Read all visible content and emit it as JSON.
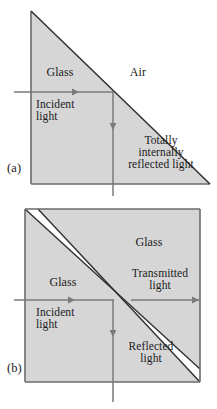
{
  "figure": {
    "colors": {
      "glass_fill": "#d6d6d6",
      "outline": "#6b6b6b",
      "diagonal_edge": "#3a3a3a",
      "air_gap": "#ffffff",
      "ray": "#7a7a7a",
      "text": "#1a1a1a",
      "background": "#ffffff"
    },
    "panels": [
      {
        "id": "a",
        "id_label": "(a)",
        "shape": "right-triangle-prism",
        "regions": [
          {
            "name": "glass-region",
            "label": "Glass",
            "x": 60,
            "y": 74
          },
          {
            "name": "air-region",
            "label": "Air",
            "x": 138,
            "y": 74
          }
        ],
        "rays": [
          {
            "name": "incident-ray",
            "label": "Incident\nlight",
            "label_line1": "Incident",
            "label_line2": "light",
            "direction": "right",
            "x1": 14,
            "y1": 92,
            "x2": 113,
            "y2": 92,
            "arrow_x": 76,
            "arrow_y": 92,
            "label_x": 46,
            "label_y": 98
          },
          {
            "name": "totally-internally-reflected-ray",
            "label": "Totally\ninternally\nreflected light",
            "label_line1": "Totally",
            "label_line2": "internally",
            "label_line3": "reflected light",
            "direction": "down",
            "x1": 113,
            "y1": 92,
            "x2": 113,
            "y2": 196,
            "arrow_x": 113,
            "arrow_y": 130,
            "label_x": 161,
            "label_y": 141
          }
        ]
      },
      {
        "id": "b",
        "id_label": "(b)",
        "shape": "square-with-diagonal-air-gap",
        "regions": [
          {
            "name": "glass-region-upper",
            "label": "Glass",
            "x": 149,
            "y": 243
          },
          {
            "name": "glass-region-lower",
            "label": "Glass",
            "x": 63,
            "y": 283
          }
        ],
        "rays": [
          {
            "name": "incident-ray",
            "label": "Incident\nlight",
            "label_line1": "Incident",
            "label_line2": "light",
            "direction": "right",
            "x1": 14,
            "y1": 300,
            "x2": 113,
            "y2": 300,
            "arrow_x": 72,
            "arrow_y": 300,
            "label_x": 46,
            "label_y": 306
          },
          {
            "name": "transmitted-ray",
            "label": "Transmitted\nlight",
            "label_line1": "Transmitted",
            "label_line2": "light",
            "direction": "right",
            "x1": 131,
            "y1": 300,
            "x2": 200,
            "y2": 300,
            "arrow_x": 198,
            "arrow_y": 300,
            "label_x": 158,
            "label_y": 274
          },
          {
            "name": "reflected-ray",
            "label": "Reflected\nlight",
            "label_line1": "Reflected",
            "label_line2": "light",
            "direction": "down",
            "x1": 113,
            "y1": 300,
            "x2": 113,
            "y2": 402,
            "arrow_x": 113,
            "arrow_y": 337,
            "label_x": 151,
            "label_y": 345
          }
        ]
      }
    ]
  }
}
